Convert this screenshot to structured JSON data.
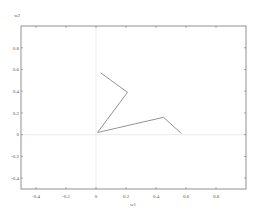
{
  "chart_data": {
    "type": "line",
    "title": "",
    "xlabel": "w1",
    "ylabel": "w2",
    "xlim": [
      -0.5,
      1.0
    ],
    "ylim": [
      -0.5,
      1.0
    ],
    "xticks": [
      -0.4,
      -0.2,
      0,
      0.2,
      0.4,
      0.6,
      0.8
    ],
    "yticks": [
      -0.4,
      -0.2,
      0,
      0.2,
      0.4,
      0.6,
      0.8
    ],
    "xtick_labels": [
      "-0.4",
      "-0.2",
      "0",
      "0.2",
      "0.4",
      "0.6",
      "0.8"
    ],
    "ytick_labels": [
      "-0.4",
      "-0.2",
      "0",
      "0.2",
      "0.4",
      "0.6",
      "0.8"
    ],
    "grid": false,
    "zero_lines": true,
    "legend": null,
    "series": [
      {
        "name": "trajectory",
        "color": "#888888",
        "x": [
          0.03,
          0.21,
          0.01,
          0.45,
          0.57
        ],
        "y": [
          0.57,
          0.39,
          0.02,
          0.16,
          0.01
        ]
      }
    ]
  },
  "colors": {
    "axis": "#777777",
    "zero_line": "#dddddd",
    "line": "#888888"
  }
}
